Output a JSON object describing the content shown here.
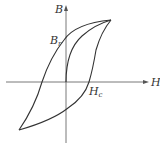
{
  "diagram": {
    "type": "hysteresis-loop",
    "axes": {
      "x_label": "H",
      "y_label": "B"
    },
    "points": {
      "remanence": {
        "symbol": "B",
        "subscript": "r"
      },
      "coercivity": {
        "symbol": "H",
        "subscript": "c"
      }
    },
    "colors": {
      "line": "#333333",
      "background": "#ffffff"
    }
  }
}
